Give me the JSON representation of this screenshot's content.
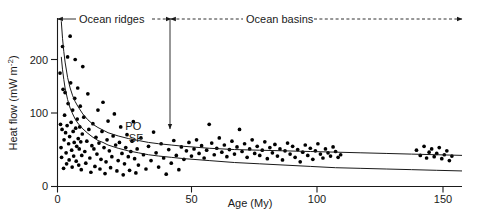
{
  "chart_data": {
    "type": "scatter",
    "title": "",
    "xlabel": "Age (My)",
    "ylabel_main": "Heat flow (mW m",
    "ylabel_exp": "-2",
    "ylabel_tail": ")",
    "xlim": [
      0,
      160
    ],
    "ylim": [
      0,
      260
    ],
    "xticks": [
      0,
      50,
      100,
      150
    ],
    "xticklabels": [
      "0",
      "50",
      "100",
      "150"
    ],
    "yticks": [
      0,
      100,
      200
    ],
    "yticklabels": [
      "0",
      "100",
      "200"
    ],
    "grid": false,
    "legend_position": "inline-curve-labels",
    "annotations": [
      {
        "name": "ocean-ridges",
        "text": "Ocean ridges",
        "x_start": 0,
        "x_end": 45,
        "style": "double-arrow-dashed"
      },
      {
        "name": "ocean-basins",
        "text": "Ocean basins",
        "x_start": 45,
        "x_end": 160,
        "style": "double-arrow-dashed"
      },
      {
        "name": "ridge-basin-divider",
        "text": "",
        "x": 45,
        "style": "vertical-arrow-down"
      }
    ],
    "series": [
      {
        "name": "PO",
        "label": "PO",
        "type": "line",
        "description": "Parsons-Sclater plate model heat flow curve",
        "label_x": 30,
        "label_y": 88,
        "points": [
          [
            1.5,
            255
          ],
          [
            2,
            228
          ],
          [
            2.5,
            208
          ],
          [
            3,
            192
          ],
          [
            4,
            168
          ],
          [
            5,
            152
          ],
          [
            6,
            140
          ],
          [
            7,
            131
          ],
          [
            8,
            124
          ],
          [
            10,
            112
          ],
          [
            12,
            103
          ],
          [
            14,
            96
          ],
          [
            16,
            91
          ],
          [
            18,
            87
          ],
          [
            20,
            83
          ],
          [
            24,
            78
          ],
          [
            28,
            74
          ],
          [
            32,
            71
          ],
          [
            36,
            68
          ],
          [
            40,
            66
          ],
          [
            45,
            64
          ],
          [
            50,
            62
          ],
          [
            60,
            59
          ],
          [
            70,
            57
          ],
          [
            80,
            56
          ],
          [
            90,
            55
          ],
          [
            100,
            54
          ],
          [
            110,
            53
          ],
          [
            120,
            52
          ],
          [
            130,
            51
          ],
          [
            140,
            50
          ],
          [
            150,
            49
          ],
          [
            160,
            48
          ]
        ]
      },
      {
        "name": "SF",
        "label": "SF",
        "type": "line",
        "description": "Half-space (square-root-of-age) cooling model heat flow curve",
        "label_x": 31,
        "label_y": 68,
        "points": [
          [
            1.5,
            200
          ],
          [
            2,
            180
          ],
          [
            2.5,
            165
          ],
          [
            3,
            152
          ],
          [
            4,
            134
          ],
          [
            5,
            121
          ],
          [
            6,
            112
          ],
          [
            7,
            104
          ],
          [
            8,
            98
          ],
          [
            10,
            89
          ],
          [
            12,
            82
          ],
          [
            14,
            76
          ],
          [
            16,
            71
          ],
          [
            18,
            68
          ],
          [
            20,
            64
          ],
          [
            24,
            59
          ],
          [
            28,
            55
          ],
          [
            32,
            52
          ],
          [
            36,
            49
          ],
          [
            40,
            47
          ],
          [
            45,
            45
          ],
          [
            50,
            43
          ],
          [
            60,
            40
          ],
          [
            70,
            37
          ],
          [
            80,
            35
          ],
          [
            90,
            33
          ],
          [
            100,
            31
          ],
          [
            110,
            29
          ],
          [
            120,
            28
          ],
          [
            130,
            27
          ],
          [
            140,
            26
          ],
          [
            150,
            25
          ],
          [
            160,
            24
          ]
        ]
      },
      {
        "name": "observed-heat-flow",
        "label": "Observed heat flow measurements",
        "type": "scatter",
        "marker": "filled-circle",
        "points": [
          [
            1.0,
            175
          ],
          [
            1.2,
            96
          ],
          [
            1.4,
            60
          ],
          [
            1.6,
            45
          ],
          [
            1.8,
            88
          ],
          [
            2.0,
            216
          ],
          [
            2.2,
            150
          ],
          [
            2.4,
            28
          ],
          [
            2.6,
            72
          ],
          [
            2.8,
            110
          ],
          [
            3.0,
            145
          ],
          [
            3.2,
            83
          ],
          [
            3.4,
            52
          ],
          [
            3.6,
            35
          ],
          [
            3.8,
            94
          ],
          [
            4.0,
            200
          ],
          [
            4.2,
            128
          ],
          [
            4.4,
            66
          ],
          [
            4.6,
            41
          ],
          [
            4.8,
            77
          ],
          [
            5.0,
            232
          ],
          [
            5.2,
            160
          ],
          [
            5.4,
            99
          ],
          [
            5.6,
            56
          ],
          [
            5.8,
            30
          ],
          [
            6.0,
            118
          ],
          [
            6.2,
            85
          ],
          [
            6.4,
            47
          ],
          [
            6.6,
            68
          ],
          [
            6.8,
            136
          ],
          [
            7.0,
            196
          ],
          [
            7.2,
            90
          ],
          [
            7.4,
            39
          ],
          [
            7.6,
            62
          ],
          [
            7.8,
            104
          ],
          [
            8.0,
            152
          ],
          [
            8.2,
            74
          ],
          [
            8.4,
            33
          ],
          [
            8.6,
            58
          ],
          [
            8.8,
            92
          ],
          [
            9.0,
            124
          ],
          [
            9.2,
            69
          ],
          [
            9.4,
            26
          ],
          [
            9.6,
            48
          ],
          [
            9.8,
            81
          ],
          [
            10.0,
            185
          ],
          [
            10.4,
            107
          ],
          [
            10.8,
            54
          ],
          [
            11.2,
            36
          ],
          [
            11.6,
            70
          ],
          [
            12.0,
            143
          ],
          [
            12.4,
            88
          ],
          [
            12.8,
            44
          ],
          [
            13.2,
            22
          ],
          [
            13.6,
            63
          ],
          [
            14.0,
            97
          ],
          [
            14.4,
            58
          ],
          [
            14.8,
            31
          ],
          [
            15.2,
            76
          ],
          [
            15.6,
            50
          ],
          [
            16.0,
            118
          ],
          [
            16.4,
            67
          ],
          [
            16.8,
            27
          ],
          [
            17.2,
            42
          ],
          [
            17.6,
            85
          ],
          [
            18.0,
            130
          ],
          [
            18.4,
            60
          ],
          [
            18.8,
            20
          ],
          [
            19.2,
            38
          ],
          [
            19.6,
            72
          ],
          [
            20.0,
            101
          ],
          [
            20.5,
            55
          ],
          [
            21.0,
            29
          ],
          [
            21.5,
            46
          ],
          [
            22.0,
            78
          ],
          [
            22.5,
            112
          ],
          [
            23.0,
            64
          ],
          [
            23.5,
            24
          ],
          [
            24.0,
            40
          ],
          [
            24.5,
            68
          ],
          [
            25.0,
            92
          ],
          [
            25.5,
            51
          ],
          [
            26.0,
            18
          ],
          [
            26.5,
            35
          ],
          [
            27.0,
            60
          ],
          [
            27.5,
            80
          ],
          [
            28.0,
            46
          ],
          [
            28.5,
            25
          ],
          [
            29.0,
            54
          ],
          [
            29.5,
            70
          ],
          [
            30.0,
            100
          ],
          [
            30.5,
            43
          ],
          [
            31.0,
            21
          ],
          [
            31.5,
            58
          ],
          [
            32.0,
            33
          ],
          [
            33.0,
            75
          ],
          [
            34.0,
            49
          ],
          [
            35.0,
            27
          ],
          [
            36.0,
            62
          ],
          [
            37.0,
            40
          ],
          [
            38.0,
            84
          ],
          [
            39.0,
            52
          ],
          [
            40.0,
            30
          ],
          [
            41.0,
            66
          ],
          [
            42.0,
            44
          ],
          [
            43.0,
            19
          ],
          [
            44.0,
            57
          ],
          [
            45.0,
            36
          ],
          [
            46.0,
            71
          ],
          [
            47.0,
            48
          ],
          [
            48.0,
            26
          ],
          [
            49.0,
            61
          ],
          [
            50.0,
            42
          ],
          [
            51.0,
            55
          ],
          [
            52.0,
            68
          ],
          [
            53.0,
            47
          ],
          [
            54.0,
            58
          ],
          [
            55.0,
            72
          ],
          [
            56.0,
            51
          ],
          [
            57.0,
            63
          ],
          [
            58.0,
            44
          ],
          [
            59.0,
            56
          ],
          [
            60.0,
            96
          ],
          [
            61.0,
            67
          ],
          [
            62.0,
            49
          ],
          [
            63.0,
            59
          ],
          [
            64.0,
            75
          ],
          [
            65.0,
            53
          ],
          [
            66.0,
            64
          ],
          [
            67.0,
            46
          ],
          [
            68.0,
            57
          ],
          [
            69.0,
            70
          ],
          [
            70.0,
            50
          ],
          [
            71.0,
            61
          ],
          [
            72.0,
            88
          ],
          [
            73.0,
            54
          ],
          [
            74.0,
            66
          ],
          [
            75.0,
            45
          ],
          [
            76.0,
            58
          ],
          [
            77.0,
            72
          ],
          [
            78.0,
            51
          ],
          [
            79.0,
            62
          ],
          [
            80.0,
            48
          ],
          [
            81.0,
            56
          ],
          [
            82.0,
            69
          ],
          [
            83.0,
            43
          ],
          [
            84.0,
            60
          ],
          [
            85.0,
            52
          ],
          [
            86.0,
            65
          ],
          [
            87.0,
            47
          ],
          [
            88.0,
            58
          ],
          [
            89.0,
            41
          ],
          [
            90.0,
            55
          ],
          [
            91.0,
            67
          ],
          [
            92.0,
            50
          ],
          [
            93.0,
            62
          ],
          [
            94.0,
            45
          ],
          [
            95.0,
            57
          ],
          [
            96.0,
            38
          ],
          [
            97.0,
            53
          ],
          [
            98.0,
            64
          ],
          [
            99.0,
            48
          ],
          [
            100.0,
            59
          ],
          [
            101.0,
            42
          ],
          [
            102.0,
            55
          ],
          [
            103.0,
            66
          ],
          [
            104.0,
            50
          ],
          [
            105.0,
            44
          ],
          [
            106.0,
            58
          ],
          [
            107.0,
            52
          ],
          [
            108.0,
            47
          ],
          [
            109.0,
            61
          ],
          [
            110.0,
            54
          ],
          [
            111.0,
            45
          ],
          [
            112.0,
            49
          ],
          [
            142.0,
            56
          ],
          [
            143.5,
            48
          ],
          [
            145.0,
            62
          ],
          [
            146.0,
            44
          ],
          [
            147.0,
            53
          ],
          [
            148.0,
            58
          ],
          [
            149.0,
            46
          ],
          [
            150.0,
            51
          ],
          [
            151.0,
            60
          ],
          [
            152.0,
            43
          ],
          [
            153.0,
            49
          ],
          [
            154.0,
            55
          ],
          [
            155.0,
            40
          ],
          [
            156.0,
            47
          ]
        ]
      }
    ]
  },
  "axes": {
    "x_axis_name": "age-axis",
    "y_axis_name": "heat-flow-axis"
  },
  "colors": {
    "ink": "#1a1a1a",
    "background": "#ffffff",
    "marker": "#000000"
  }
}
